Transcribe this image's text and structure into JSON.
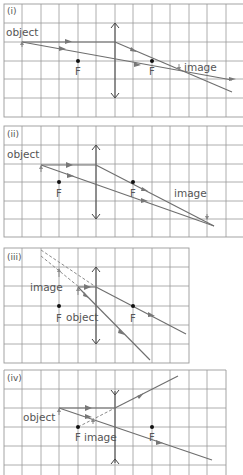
{
  "panels": [
    {
      "id": "i",
      "label": "(i)",
      "object_label": "object",
      "image_label": "image",
      "focal_labels": [
        "F",
        "F"
      ],
      "lens_type": "converging"
    },
    {
      "id": "ii",
      "label": "(ii)",
      "object_label": "object",
      "image_label": "image",
      "focal_labels": [
        "F",
        "F"
      ],
      "lens_type": "converging"
    },
    {
      "id": "iii",
      "label": "(iii)",
      "object_label": "object",
      "image_label": "image",
      "focal_labels": [
        "F",
        "F"
      ],
      "lens_type": "converging"
    },
    {
      "id": "iv",
      "label": "(iv)",
      "object_label": "object",
      "image_label": "image",
      "focal_labels": [
        "F",
        "F"
      ],
      "lens_type": "diverging"
    }
  ],
  "colors": {
    "grid": "#9a9a9a",
    "ray": "#6e6e6e",
    "text": "#555555",
    "focal_dot": "#111111"
  }
}
